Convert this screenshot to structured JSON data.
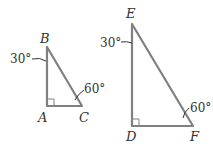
{
  "figure": {
    "triangle_abc": {
      "vertices": {
        "B": "B",
        "A": "A",
        "C": "C"
      },
      "angles": {
        "B": "30°",
        "C": "60°"
      },
      "right_angle_at": "A"
    },
    "triangle_def": {
      "vertices": {
        "E": "E",
        "D": "D",
        "F": "F"
      },
      "angles": {
        "E": "30°",
        "F": "60°"
      },
      "right_angle_at": "D"
    },
    "colors": {
      "line": "#808080",
      "text": "#333333"
    }
  }
}
